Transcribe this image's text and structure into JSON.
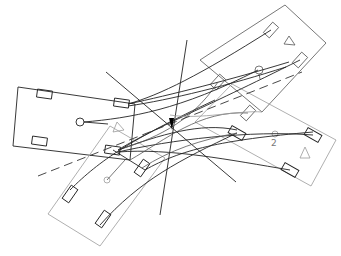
{
  "diagram": {
    "title": "",
    "labels": [
      {
        "id": "node-label-2",
        "text": "2",
        "x": 270,
        "y": 145
      }
    ],
    "colors": {
      "background": "#ffffff",
      "dark_stroke": "#222222",
      "mid_stroke": "#555555",
      "light_stroke": "#9a9a9a",
      "center_marker": "#000000"
    }
  }
}
